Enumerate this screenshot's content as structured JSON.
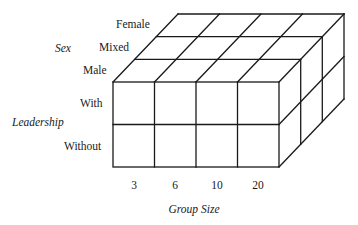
{
  "diagram": {
    "type": "3d-factorial-cube",
    "dimensions": {
      "x": {
        "title": "Group Size",
        "levels": [
          "3",
          "6",
          "10",
          "20"
        ]
      },
      "y": {
        "title": "Leadership",
        "levels": [
          "With",
          "Without"
        ]
      },
      "z": {
        "title": "Sex",
        "levels": [
          "Female",
          "Mixed",
          "Male"
        ]
      }
    },
    "labels": {
      "sex_title": "Sex",
      "sex_female": "Female",
      "sex_mixed": "Mixed",
      "sex_male": "Male",
      "leadership_title": "Leadership",
      "leadership_with": "With",
      "leadership_without": "Without",
      "group_title": "Group Size",
      "group_3": "3",
      "group_6": "6",
      "group_10": "10",
      "group_20": "20"
    },
    "colors": {
      "line": "#1a1a1a",
      "background": "#ffffff"
    }
  }
}
